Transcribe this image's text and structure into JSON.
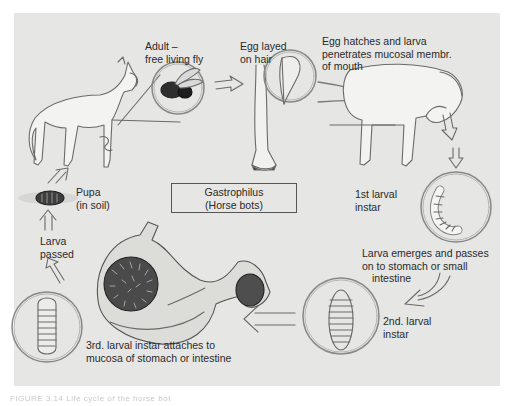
{
  "diagram": {
    "title": "Gastrophilus",
    "subtitle": "(Horse bots)",
    "background": "#e6e6e4",
    "stages": [
      {
        "id": "adult",
        "line1": "Adult –",
        "line2": "free living fly"
      },
      {
        "id": "egg",
        "line1": "Egg layed",
        "line2": "on hair"
      },
      {
        "id": "hatch",
        "line1": "Egg hatches and larva",
        "line2": "penetrates mucosal membr.",
        "line3": "of mouth"
      },
      {
        "id": "first_instar",
        "line1": "1st larval",
        "line2": "instar"
      },
      {
        "id": "emerges",
        "line1": "Larva emerges and passes",
        "line2": "on to stomach or small",
        "line3": "intestine"
      },
      {
        "id": "second_instar",
        "line1": "2nd. larval",
        "line2": "instar"
      },
      {
        "id": "third_instar",
        "line1": "3rd. larval instar attaches to",
        "line2": "mucosa of stomach or intestine"
      },
      {
        "id": "passed",
        "line1": "Larva",
        "line2": "passed"
      },
      {
        "id": "pupa",
        "line1": "Pupa",
        "line2": "(in soil)"
      }
    ],
    "caption": "FIGURE 3.14  Life cycle of the horse bot"
  }
}
